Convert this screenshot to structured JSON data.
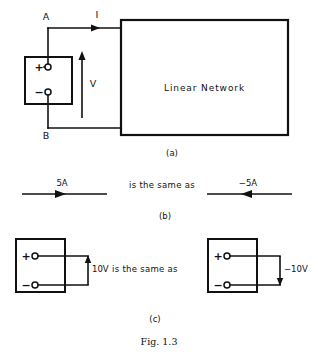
{
  "figure": {
    "caption": "Fig. 1.3",
    "panels": [
      {
        "id": "a",
        "label": "(a)",
        "network_label": "Linear Network",
        "node_a": "A",
        "node_b": "B",
        "current_label": "I",
        "voltage_label": "V",
        "source_plus": "+",
        "source_minus": "−"
      },
      {
        "id": "b",
        "label": "(b)",
        "left_current": "5A",
        "right_current": "−5A",
        "equivalence_text": "is the same as"
      },
      {
        "id": "c",
        "label": "(c)",
        "left_voltage": "10V",
        "right_voltage": "−10V",
        "equivalence_text": "is the same as",
        "left_box_plus": "+",
        "left_box_minus": "−",
        "right_box_plus": "+",
        "right_box_minus": "−"
      }
    ]
  },
  "colors": {
    "ink": "#111111",
    "paper": "#ffffff"
  }
}
